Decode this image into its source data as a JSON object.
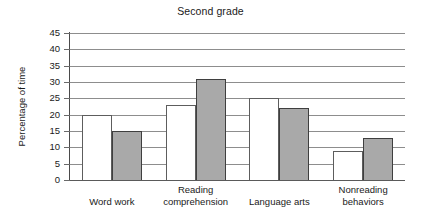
{
  "chart_data": {
    "type": "bar",
    "title": "Second grade",
    "xlabel": "",
    "ylabel": "Percentage of time",
    "ylim": [
      0,
      45
    ],
    "ytick_step": 5,
    "yticks": [
      "45",
      "40",
      "35",
      "30",
      "25",
      "20",
      "15",
      "10",
      "5",
      "0"
    ],
    "grid": true,
    "legend": "none",
    "categories": [
      "Word work",
      "Reading comprehension",
      "Language arts",
      "Nonreading behaviors"
    ],
    "category_lines": [
      [
        "Word work"
      ],
      [
        "Reading",
        "comprehension"
      ],
      [
        "Language arts"
      ],
      [
        "Nonreading",
        "behaviors"
      ]
    ],
    "series": [
      {
        "name": "white",
        "color": "#ffffff",
        "values": [
          20,
          23,
          25,
          9
        ]
      },
      {
        "name": "gray",
        "color": "#a9a9a9",
        "values": [
          15,
          31,
          22,
          13
        ]
      }
    ]
  },
  "colors": {
    "series_white": "#ffffff",
    "series_gray": "#a9a9a9",
    "grid": "#8d8d8d",
    "axis": "#4a4a4a",
    "text": "#1a1a1a",
    "background": "#ffffff"
  }
}
